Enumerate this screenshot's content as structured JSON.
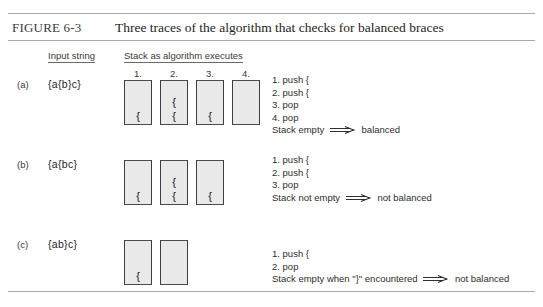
{
  "figure": {
    "label": "FIGURE 6-3",
    "title": "Three traces of the algorithm that checks for balanced braces"
  },
  "headers": {
    "input": "Input string",
    "stack": "Stack as algorithm executes"
  },
  "rows": [
    {
      "letter": "(a)",
      "input": "{a{b}c}",
      "steps": [
        "1.",
        "2.",
        "3.",
        "4."
      ],
      "stacks": [
        [
          "{"
        ],
        [
          "{",
          "{"
        ],
        [
          "{"
        ],
        []
      ],
      "trace": [
        "1. push {",
        "2. push {",
        "3. pop",
        "4. pop"
      ],
      "conclusion_left": "Stack empty",
      "conclusion_right": "balanced"
    },
    {
      "letter": "(b)",
      "input": "{a{bc}",
      "steps": [],
      "stacks": [
        [
          "{"
        ],
        [
          "{",
          "{"
        ],
        [
          "{"
        ]
      ],
      "trace": [
        "1. push {",
        "2. push {",
        "3. pop"
      ],
      "conclusion_left": "Stack not empty",
      "conclusion_right": "not balanced"
    },
    {
      "letter": "(c)",
      "input": "{ab}c}",
      "steps": [],
      "stacks": [
        [
          "{"
        ],
        []
      ],
      "trace": [
        "1. push {",
        "2. pop"
      ],
      "conclusion_left": "Stack empty when \"}\" encountered",
      "conclusion_right": "not balanced"
    }
  ]
}
